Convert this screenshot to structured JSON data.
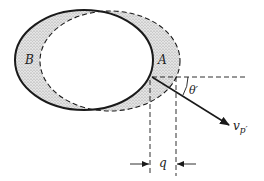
{
  "diagram": {
    "labels": {
      "region_a": "A",
      "region_b": "B",
      "angle": "θ′",
      "velocity": "v",
      "velocity_sub": "p′",
      "offset": "q"
    },
    "colors": {
      "stroke": "#1a1a1a",
      "shade": "#d4d4d4",
      "background": "#ffffff"
    }
  }
}
